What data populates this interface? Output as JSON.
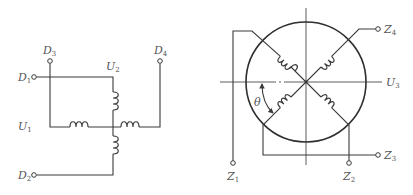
{
  "figure": {
    "left_diagram": {
      "title": "Four-terminal Hall element bridge",
      "labels": {
        "D1": {
          "main": "D",
          "sub": "1"
        },
        "D2": {
          "main": "D",
          "sub": "2"
        },
        "D3": {
          "main": "D",
          "sub": "3"
        },
        "D4": {
          "main": "D",
          "sub": "4"
        },
        "U1": {
          "main": "U",
          "sub": "1"
        },
        "U2": {
          "main": "U",
          "sub": "2"
        }
      }
    },
    "right_diagram": {
      "title": "Rotor winding circle with four coils",
      "labels": {
        "Z1": {
          "main": "Z",
          "sub": "1"
        },
        "Z2": {
          "main": "Z",
          "sub": "2"
        },
        "Z3": {
          "main": "Z",
          "sub": "3"
        },
        "Z4": {
          "main": "Z",
          "sub": "4"
        },
        "U3": {
          "main": "U",
          "sub": "3"
        },
        "theta": {
          "main": "θ"
        }
      }
    },
    "colors": {
      "line": "#3a3a3a",
      "text": "#555555",
      "background": "#ffffff"
    }
  }
}
